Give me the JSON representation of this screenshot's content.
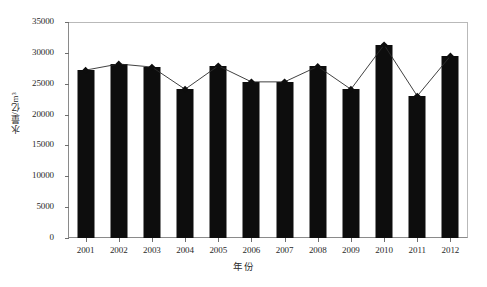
{
  "chart_data": {
    "type": "bar",
    "title": "",
    "subtitle": "",
    "xlabel": "年份",
    "ylabel": "水量/亿m³",
    "categories": [
      "2001",
      "2002",
      "2003",
      "2004",
      "2005",
      "2006",
      "2007",
      "2008",
      "2009",
      "2010",
      "2011",
      "2012"
    ],
    "values": [
      27200,
      28200,
      27700,
      24100,
      27900,
      25300,
      25300,
      27800,
      24100,
      31300,
      23000,
      29500
    ],
    "series": [
      {
        "name": "水量",
        "type": "bar",
        "values": [
          27200,
          28200,
          27700,
          24100,
          27900,
          25300,
          25300,
          27800,
          24100,
          31300,
          23000,
          29500
        ]
      },
      {
        "name": "趋势线",
        "type": "line",
        "marker": "diamond",
        "values": [
          27200,
          28200,
          27700,
          24100,
          27900,
          25300,
          25300,
          27800,
          24100,
          31300,
          23000,
          29500
        ]
      }
    ],
    "ylim": [
      0,
      35000
    ],
    "ytick_step": 5000,
    "yticks": [
      0,
      5000,
      10000,
      15000,
      20000,
      25000,
      30000,
      35000
    ],
    "ytick_labels": [
      "0",
      "5000",
      "10000",
      "15000",
      "20000",
      "25000",
      "30000",
      "35000"
    ],
    "grid": false,
    "legend": null,
    "legend_position": "none",
    "colors": {
      "bar": "#0d0d0d",
      "line": "#2b2b2b",
      "marker": "#0d0d0d",
      "axis": "#6e6e6e",
      "frame": "#b9b9b9",
      "background": "#ffffff",
      "text": "#2a2a2a"
    }
  }
}
